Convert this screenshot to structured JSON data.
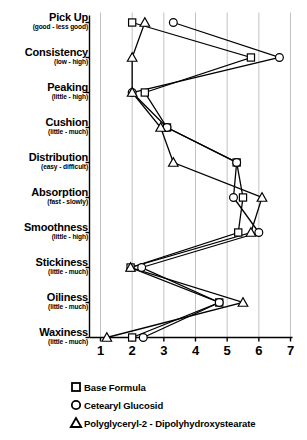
{
  "chart_data": {
    "type": "line",
    "title": "",
    "subtitle": "",
    "xlabel": "",
    "ylabel": "",
    "orientation": "horizontal",
    "grid": true,
    "grid_axis": "x",
    "legend_position": "bottom",
    "xlim": [
      1,
      7
    ],
    "xticks": [
      "1",
      "2",
      "3",
      "4",
      "5",
      "6",
      "7"
    ],
    "xtick_values": [
      1,
      2,
      3,
      4,
      5,
      6,
      7
    ],
    "categories": [
      "Pick Up",
      "Consistency",
      "Peaking",
      "Cushion",
      "Distribution",
      "Absorption",
      "Smoothness",
      "Stickiness",
      "Oiliness",
      "Waxiness"
    ],
    "category_scales": [
      "(good - less good)",
      "(low - high)",
      "(little - high)",
      "(little - much)",
      "(easy - difficult)",
      "(fast - slowly)",
      "(little - high)",
      "(little - much)",
      "(little - much)",
      "(little - much)"
    ],
    "series": [
      {
        "name": "Base Formula",
        "marker": "square",
        "values": [
          2.0,
          5.75,
          2.4,
          3.1,
          5.3,
          5.5,
          5.35,
          1.95,
          4.75,
          2.0
        ]
      },
      {
        "name": "Cetearyl Glucosid",
        "marker": "circle",
        "values": [
          3.3,
          6.65,
          2.0,
          3.1,
          5.3,
          5.2,
          6.0,
          2.3,
          4.75,
          2.35
        ]
      },
      {
        "name": "Polyglyceryl-2 - Dipolyhydroxystearate",
        "marker": "triangle",
        "values": [
          2.4,
          2.0,
          2.0,
          2.9,
          3.3,
          6.1,
          5.75,
          1.95,
          5.5,
          1.2
        ]
      }
    ],
    "colors": {
      "line": "#000000",
      "marker_fill": "#ffffff",
      "marker_stroke": "#000000",
      "grid": "#b4b4b4",
      "axis": "#000000",
      "background": "#ffffff"
    }
  },
  "legend": {
    "items": [
      {
        "marker": "square-marker",
        "label": "Base Formula"
      },
      {
        "marker": "circle-marker",
        "label": "Cetearyl Glucosid"
      },
      {
        "marker": "triangle-marker",
        "label": "Polyglyceryl-2 - Dipolyhydroxystearate"
      }
    ]
  }
}
